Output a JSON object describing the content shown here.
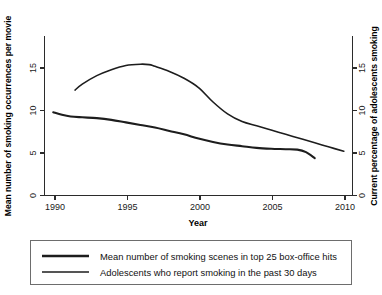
{
  "chart_data": {
    "type": "line",
    "title": "",
    "xlabel": "Year",
    "ylabel": "Mean number of  smoking occurrences per movie",
    "y2label": "Current percentage of adolescents smoking",
    "xlim": [
      1989.4,
      2010.6
    ],
    "ylim": [
      0,
      17.2
    ],
    "y2lim": [
      0,
      17.2
    ],
    "xticks": [
      "1990",
      "1995",
      "2000",
      "2005",
      "2010"
    ],
    "xtick_values": [
      1990,
      1995,
      2000,
      2005,
      2010
    ],
    "yticks": [
      "0",
      "5",
      "10",
      "15"
    ],
    "ytick_values": [
      0,
      5,
      10,
      15
    ],
    "y2ticks": [
      "0",
      "5",
      "10",
      "15"
    ],
    "y2tick_values": [
      0,
      5,
      10,
      15
    ],
    "grid": false,
    "legend_position": "below",
    "series": [
      {
        "name": "Mean number of smoking scenes in top 25 box-office hits",
        "axis": "left",
        "x": [
          1990,
          1990.6,
          1991.2,
          1992,
          1993,
          1994,
          1995,
          1996,
          1997,
          1998,
          1999,
          2000,
          2001,
          2002,
          2003,
          2004,
          2005,
          2006,
          2006.8,
          2007.4,
          2008
        ],
        "values": [
          9.8,
          9.5,
          9.3,
          9.2,
          9.1,
          8.9,
          8.6,
          8.3,
          8.0,
          7.6,
          7.2,
          6.7,
          6.3,
          6.0,
          5.8,
          5.6,
          5.5,
          5.45,
          5.4,
          5.1,
          4.4
        ]
      },
      {
        "name": "Adolescents who report smoking in the past 30 days",
        "axis": "right",
        "x": [
          1991.5,
          1992,
          1993,
          1994,
          1995,
          1996,
          1996.6,
          1997,
          1998,
          1999,
          2000,
          2001,
          2002,
          2003,
          2004,
          2005,
          2006,
          2007,
          2008,
          2009,
          2010
        ],
        "values": [
          12.4,
          13.1,
          14.1,
          14.8,
          15.3,
          15.45,
          15.4,
          15.2,
          14.6,
          13.8,
          12.7,
          11.0,
          9.6,
          8.7,
          8.2,
          7.7,
          7.2,
          6.7,
          6.2,
          5.7,
          5.2
        ]
      }
    ]
  },
  "legend": {
    "items": [
      {
        "label": "Mean number of smoking scenes in top 25 box-office hits"
      },
      {
        "label": "Adolescents who report smoking in the past 30 days"
      }
    ]
  },
  "axes": {
    "x_title": "Year",
    "y_left_title": "Mean number of  smoking occurrences per movie",
    "y_right_title": "Current percentage of adolescents smoking"
  },
  "colors": {
    "line": "#1d1d1d",
    "axis": "#2b2b2b",
    "legend_border": "#6d6d6d",
    "background": "#ffffff"
  }
}
